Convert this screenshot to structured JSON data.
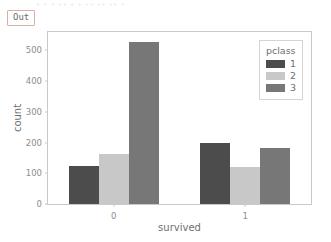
{
  "top_clipped_text": "• • •  •• •  • •• ••  •• •",
  "out_prompt": {
    "label": "Out",
    "border_color": "#d9b0a8"
  },
  "chart_data": {
    "type": "bar",
    "title": "",
    "xlabel": "survived",
    "ylabel": "count",
    "categories": [
      "0",
      "1"
    ],
    "series": [
      {
        "name": "1",
        "values": [
          123,
          200
        ],
        "color": "#4c4c4c"
      },
      {
        "name": "2",
        "values": [
          162,
          119
        ],
        "color": "#c8c8c8"
      },
      {
        "name": "3",
        "values": [
          527,
          181
        ],
        "color": "#777777"
      }
    ],
    "legend": {
      "title": "pclass",
      "position": "upper right",
      "entries": [
        "1",
        "2",
        "3"
      ]
    },
    "ylim": [
      0,
      560
    ],
    "yticks": [
      0,
      100,
      200,
      300,
      400,
      500
    ],
    "ytick_labels": [
      "0",
      "100",
      "200",
      "300",
      "400",
      "500"
    ],
    "xtick_labels": [
      "0",
      "1"
    ],
    "grid": false,
    "frame_color": "#c9c9c9",
    "tick_label_color": "#8d8d8d",
    "axis_label_color": "#6f6f6f"
  }
}
